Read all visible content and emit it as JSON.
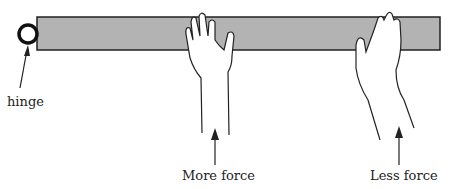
{
  "diagram": {
    "bar_color": "#b3b3b3",
    "labels": {
      "hinge": "hinge",
      "more_force": "More force",
      "less_force": "Less force"
    }
  }
}
